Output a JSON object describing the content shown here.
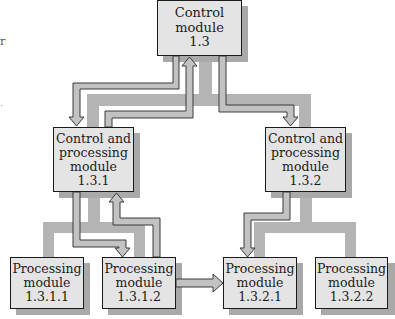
{
  "diagram": {
    "type": "hierarchy",
    "colors": {
      "box_fill": "#e4e4e4",
      "box_border": "#1a1a1a",
      "shadow": "#a9a9a9",
      "tree_connector": "#b4b4b4",
      "arrow_fill": "#bdbdbd",
      "arrow_outline": "#3a3a3a"
    },
    "nodes": {
      "root": {
        "id": "1.3",
        "lines": [
          "Control",
          "module",
          "1.3"
        ]
      },
      "left": {
        "id": "1.3.1",
        "lines": [
          "Control and",
          "processing",
          "module",
          "1.3.1"
        ]
      },
      "right": {
        "id": "1.3.2",
        "lines": [
          "Control and",
          "processing",
          "module",
          "1.3.2"
        ]
      },
      "ll": {
        "id": "1.3.1.1",
        "lines": [
          "Processing",
          "module",
          "1.3.1.1"
        ]
      },
      "lr": {
        "id": "1.3.1.2",
        "lines": [
          "Processing",
          "module",
          "1.3.1.2"
        ]
      },
      "rl": {
        "id": "1.3.2.1",
        "lines": [
          "Processing",
          "module",
          "1.3.2.1"
        ]
      },
      "rr": {
        "id": "1.3.2.2",
        "lines": [
          "Processing",
          "module",
          "1.3.2.2"
        ]
      }
    },
    "edges_hierarchy": [
      [
        "1.3",
        "1.3.1"
      ],
      [
        "1.3",
        "1.3.2"
      ],
      [
        "1.3.1",
        "1.3.1.1"
      ],
      [
        "1.3.1",
        "1.3.1.2"
      ],
      [
        "1.3.2",
        "1.3.2.1"
      ],
      [
        "1.3.2",
        "1.3.2.2"
      ]
    ],
    "arrows": [
      {
        "from": "1.3",
        "to": "1.3.1"
      },
      {
        "from": "1.3.1",
        "to": "1.3"
      },
      {
        "from": "1.3",
        "to": "1.3.2"
      },
      {
        "from": "1.3.1",
        "to": "1.3.1.2"
      },
      {
        "from": "1.3.1.2",
        "to": "1.3.1"
      },
      {
        "from": "1.3.2",
        "to": "1.3.2.1"
      },
      {
        "from": "1.3.1.2",
        "to": "1.3.2.1"
      }
    ]
  },
  "stray_marks": {
    "mark1": "r",
    "mark2": "·"
  }
}
